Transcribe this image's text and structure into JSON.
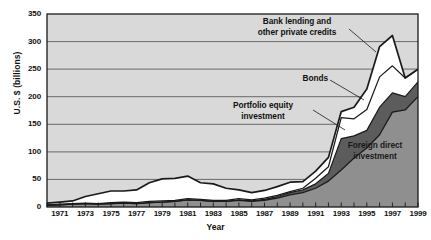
{
  "axes": {
    "ylabel": "U.S. $ (billions)",
    "xlabel": "Year",
    "yticks": [
      "0",
      "50",
      "100",
      "150",
      "200",
      "250",
      "300",
      "350"
    ],
    "xticks": [
      "1971",
      "1973",
      "1975",
      "1977",
      "1979",
      "1981",
      "1983",
      "1985",
      "1987",
      "1989",
      "1991",
      "1993",
      "1995",
      "1997",
      "1999"
    ]
  },
  "annotations": {
    "bank": "Bank lending and\nother private credits",
    "bank_line1": "Bank lending and",
    "bank_line2": "other private credits",
    "bonds": "Bonds",
    "equity_line1": "Portfolio equity",
    "equity_line2": "investment",
    "fdi_line1": "Foreign direct",
    "fdi_line2": "investment"
  },
  "colors": {
    "plot_background": "#d9d9d9",
    "fdi": "#8f8f8f",
    "equity": "#5c5c5c",
    "bonds": "#ffffff",
    "bank": "#ffffff",
    "axis": "#1a1a1a",
    "gridline": "#4d4d4d"
  },
  "chart_data": {
    "type": "area",
    "title": "",
    "xlabel": "Year",
    "ylabel": "U.S. $ (billions)",
    "stacked": true,
    "grid": true,
    "legend_position": "in-plot-annotations",
    "xlim": [
      1970,
      1999
    ],
    "ylim": [
      0,
      350
    ],
    "x": [
      1970,
      1971,
      1972,
      1973,
      1974,
      1975,
      1976,
      1977,
      1978,
      1979,
      1980,
      1981,
      1982,
      1983,
      1984,
      1985,
      1986,
      1987,
      1988,
      1989,
      1990,
      1991,
      1992,
      1993,
      1994,
      1995,
      1996,
      1997,
      1998,
      1999
    ],
    "series": [
      {
        "name": "Foreign direct investment",
        "values": [
          3,
          4,
          5,
          6,
          5,
          6,
          7,
          6,
          8,
          9,
          10,
          13,
          12,
          10,
          10,
          12,
          10,
          12,
          16,
          22,
          26,
          34,
          47,
          67,
          89,
          107,
          131,
          172,
          176,
          200
        ]
      },
      {
        "name": "Portfolio equity investment",
        "values": [
          0,
          0,
          0,
          0,
          0,
          0,
          0,
          0,
          0,
          0,
          0,
          0,
          0,
          0,
          0,
          1,
          1,
          2,
          3,
          4,
          5,
          8,
          14,
          57,
          40,
          32,
          50,
          35,
          24,
          27
        ]
      },
      {
        "name": "Bonds",
        "values": [
          1,
          1,
          1,
          1,
          1,
          2,
          2,
          2,
          2,
          2,
          2,
          2,
          2,
          2,
          2,
          2,
          2,
          2,
          2,
          2,
          3,
          10,
          12,
          38,
          31,
          38,
          55,
          49,
          34,
          23
        ]
      },
      {
        "name": "Bank lending and other private credits",
        "values": [
          3,
          4,
          5,
          12,
          18,
          21,
          20,
          23,
          34,
          40,
          40,
          41,
          30,
          30,
          22,
          16,
          13,
          14,
          16,
          17,
          12,
          13,
          17,
          11,
          21,
          37,
          55,
          55,
          0,
          0
        ]
      }
    ],
    "series_totals": [
      7,
      9,
      11,
      19,
      24,
      29,
      29,
      31,
      44,
      51,
      52,
      68,
      56,
      49,
      43,
      42,
      32,
      34,
      41,
      45,
      46,
      65,
      90,
      173,
      181,
      214,
      291,
      311,
      234,
      250
    ]
  }
}
